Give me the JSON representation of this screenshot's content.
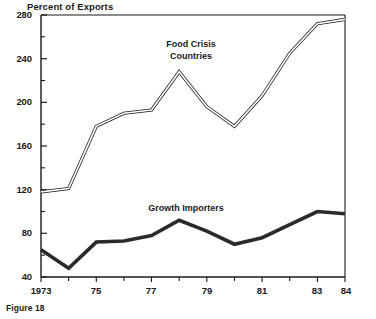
{
  "figure": {
    "caption": "Figure 18"
  },
  "chart_data": {
    "type": "line",
    "title": "",
    "ylabel": "Percent of Exports",
    "xlabel": "",
    "ylim": [
      40,
      280
    ],
    "xlim": [
      1973,
      1984
    ],
    "y_ticks_major": [
      40,
      80,
      120,
      160,
      200,
      240,
      280
    ],
    "y_ticks_minor": [
      60,
      100,
      140,
      180,
      220,
      260
    ],
    "y_tick_labels": [
      "40",
      "80",
      "120",
      "160",
      "200",
      "240",
      "280"
    ],
    "x_ticks": [
      1973,
      1974,
      1975,
      1976,
      1977,
      1978,
      1979,
      1980,
      1981,
      1982,
      1983,
      1984
    ],
    "x_tick_labels": [
      "1973",
      "",
      "75",
      "",
      "77",
      "",
      "79",
      "",
      "81",
      "",
      "83",
      "84"
    ],
    "x_labeled_years": [
      1973,
      1975,
      1977,
      1979,
      1981,
      1983,
      1984
    ],
    "grid": false,
    "legend": "inline-annotations",
    "x": [
      1973,
      1974,
      1975,
      1976,
      1977,
      1978,
      1979,
      1980,
      1981,
      1982,
      1983,
      1984
    ],
    "series": [
      {
        "name": "Food Crisis Countries",
        "style": "hollow-double-line",
        "color": "#1a1a1a",
        "values": [
          118,
          121,
          178,
          190,
          193,
          228,
          196,
          178,
          206,
          245,
          272,
          276
        ],
        "label_x": 1978.0,
        "label_y": 250
      },
      {
        "name": "Growth Importers",
        "style": "thick-solid-line",
        "color": "#2a2a2a",
        "values": [
          65,
          48,
          72,
          73,
          78,
          92,
          82,
          70,
          76,
          88,
          100,
          98
        ],
        "label_x": 1978.5,
        "label_y": 112
      }
    ]
  },
  "annotations": {
    "food_crisis_label_line1": "Food Crisis",
    "food_crisis_label_line2": "Countries",
    "growth_importers_label": "Growth Importers"
  },
  "axis": {
    "y_title": "Percent of Exports"
  }
}
